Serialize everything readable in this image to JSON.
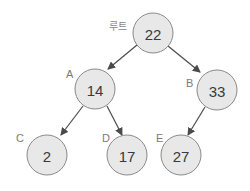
{
  "diagram": {
    "type": "binary-search-tree",
    "root_label": "루트",
    "nodes": [
      {
        "id": "root",
        "label": "",
        "value": "22",
        "cx": 153,
        "cy": 33
      },
      {
        "id": "A",
        "label": "A",
        "value": "14",
        "cx": 95,
        "cy": 89
      },
      {
        "id": "B",
        "label": "B",
        "value": "33",
        "cx": 217,
        "cy": 90
      },
      {
        "id": "C",
        "label": "C",
        "value": "2",
        "cx": 47,
        "cy": 155
      },
      {
        "id": "D",
        "label": "D",
        "value": "17",
        "cx": 127,
        "cy": 155
      },
      {
        "id": "E",
        "label": "E",
        "value": "27",
        "cx": 181,
        "cy": 155
      }
    ],
    "edges": [
      {
        "from": "root",
        "to": "A"
      },
      {
        "from": "root",
        "to": "B"
      },
      {
        "from": "A",
        "to": "C"
      },
      {
        "from": "A",
        "to": "D"
      },
      {
        "from": "B",
        "to": "E"
      }
    ],
    "colors": {
      "node_fill": "#e8e8e8",
      "node_stroke": "#8a8a8a",
      "value_text": "#3a3a3a",
      "label_text": "#7a7a7a",
      "edge": "#4a4a4a"
    }
  }
}
